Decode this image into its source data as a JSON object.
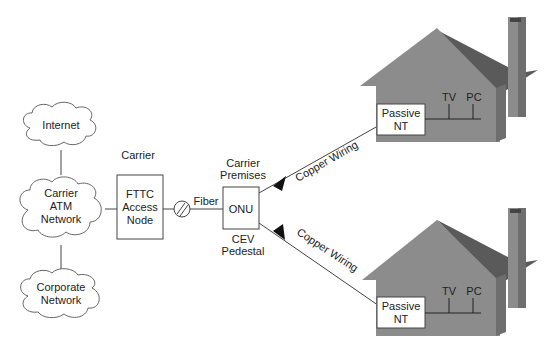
{
  "diagram": {
    "clouds": {
      "internet": [
        "Internet"
      ],
      "carrier_atm": [
        "Carrier",
        "ATM",
        "Network"
      ],
      "corporate": [
        "Corporate",
        "Network"
      ]
    },
    "carrier_label": "Carrier",
    "fttc_node": [
      "FTTC",
      "Access",
      "Node"
    ],
    "fiber_label": "Fiber",
    "onu_label": "ONU",
    "carrier_premises": [
      "Carrier",
      "Premises"
    ],
    "cev_pedestal": [
      "CEV",
      "Pedestal"
    ],
    "copper_top": "Copper Wiring",
    "copper_bottom": "Copper Wiring",
    "house_top": {
      "nt": [
        "Passive",
        "NT"
      ],
      "tv": "TV",
      "pc": "PC"
    },
    "house_bottom": {
      "nt": [
        "Passive",
        "NT"
      ],
      "tv": "TV",
      "pc": "PC"
    },
    "colors": {
      "house_wall": "#8c8c8c",
      "house_roof": "#5a5a5a",
      "house_side": "#6e6e6e",
      "line": "#333333"
    }
  }
}
